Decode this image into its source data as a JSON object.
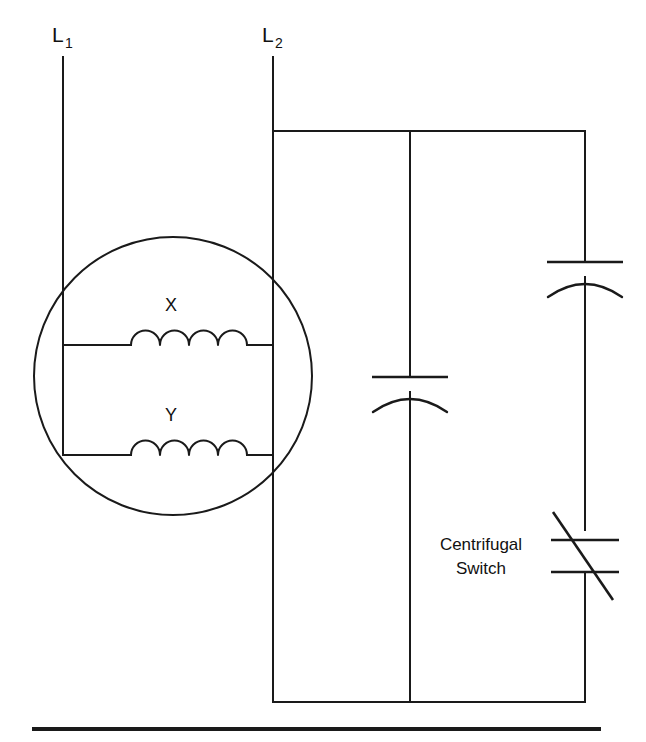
{
  "diagram": {
    "stroke_color": "#1a1a1a",
    "background_color": "#ffffff"
  },
  "terminals": [
    {
      "id": "L1",
      "base": "L",
      "subscript": "1",
      "x": 52,
      "y": 42
    },
    {
      "id": "L2",
      "base": "L",
      "subscript": "2",
      "x": 262,
      "y": 42
    }
  ],
  "motor": {
    "label": "motor",
    "windings": [
      {
        "id": "X",
        "label": "X",
        "label_x": 171,
        "label_y": 311
      },
      {
        "id": "Y",
        "label": "Y",
        "label_y": 421,
        "label_x": 171
      }
    ]
  },
  "components": {
    "run_capacitor": {
      "name": "capacitor",
      "type": "polarized-capacitor",
      "branch": "middle"
    },
    "start_capacitor": {
      "name": "capacitor",
      "type": "polarized-capacitor",
      "branch": "right"
    },
    "centrifugal_switch": {
      "name": "centrifugal-switch",
      "type": "switch",
      "label_line_1": "Centrifugal",
      "label_line_2": "Switch",
      "label_x": 481,
      "label_y_1": 550,
      "label_y_2": 574
    }
  },
  "icons": {
    "coil": "coil-icon",
    "capacitor": "capacitor-icon",
    "switch": "switch-icon",
    "motor": "motor-circle-icon"
  }
}
